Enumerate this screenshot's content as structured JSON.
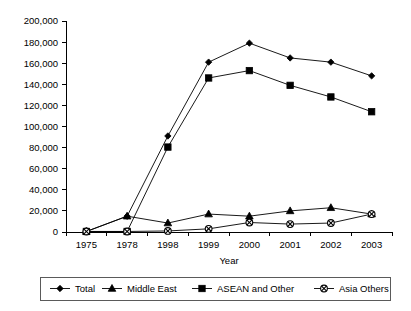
{
  "chart_data": {
    "type": "line",
    "title": "",
    "xlabel": "Year",
    "ylabel": "",
    "categories": [
      "1975",
      "1978",
      "1998",
      "1999",
      "2000",
      "2001",
      "2002",
      "2003"
    ],
    "ylim": [
      0,
      200000
    ],
    "ytick_step": 20000,
    "yticks": [
      0,
      20000,
      40000,
      60000,
      80000,
      100000,
      120000,
      140000,
      160000,
      180000,
      200000
    ],
    "ytick_labels": [
      "0",
      "20,000",
      "40,000",
      "60,000",
      "80,000",
      "100,000",
      "120,000",
      "140,000",
      "160,000",
      "180,000",
      "200,000"
    ],
    "grid": false,
    "legend_position": "bottom",
    "series": [
      {
        "name": "Total",
        "marker": "diamond",
        "values": [
          500,
          15000,
          91000,
          161000,
          179000,
          165000,
          161000,
          148000
        ]
      },
      {
        "name": "Middle East",
        "marker": "triangle",
        "values": [
          500,
          15000,
          8500,
          17000,
          15000,
          20000,
          23000,
          17000
        ]
      },
      {
        "name": "ASEAN and Other",
        "marker": "square",
        "values": [
          500,
          500,
          80500,
          146000,
          153000,
          139000,
          128000,
          114000
        ]
      },
      {
        "name": "Asia Others",
        "marker": "circle-x",
        "values": [
          500,
          500,
          1000,
          3000,
          9000,
          7500,
          8500,
          17000
        ]
      }
    ]
  },
  "legend": {
    "items": [
      {
        "label": "Total",
        "marker": "diamond"
      },
      {
        "label": "Middle East",
        "marker": "triangle"
      },
      {
        "label": "ASEAN and Other",
        "marker": "square"
      },
      {
        "label": "Asia Others",
        "marker": "circle-x"
      }
    ]
  },
  "colors": {
    "line": "#000000",
    "marker": "#000000",
    "axis": "#000000",
    "legend_border": "#5a5a5a",
    "background": "#ffffff"
  }
}
